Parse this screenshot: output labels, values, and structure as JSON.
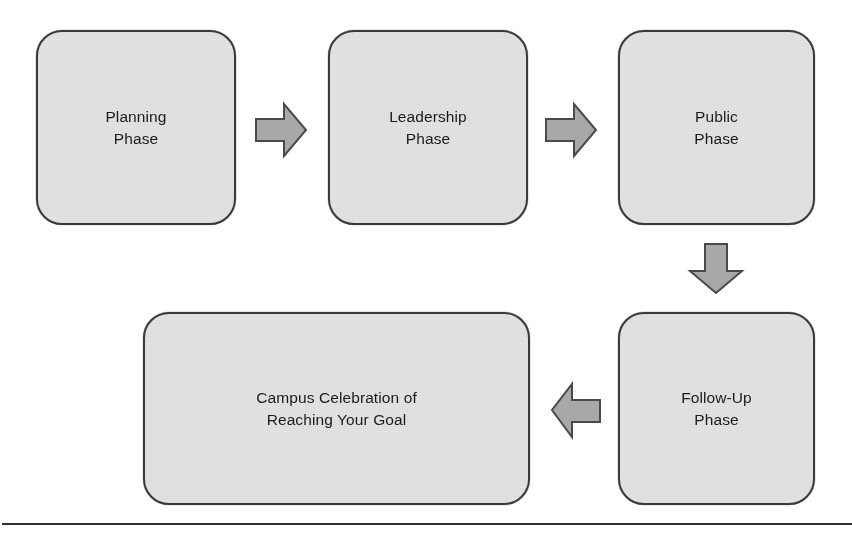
{
  "diagram": {
    "colors": {
      "box_fill": "#e4e4e4",
      "box_border": "#3a3a3a",
      "arrow_fill": "#a8a8a8",
      "arrow_border": "#4a4a4a",
      "text": "#1b1b1b",
      "rule": "#2e2e2e",
      "background": "#ffffff"
    },
    "nodes": [
      {
        "id": "planning",
        "label": "Planning\nPhase"
      },
      {
        "id": "leadership",
        "label": "Leadership\nPhase"
      },
      {
        "id": "public",
        "label": "Public\nPhase"
      },
      {
        "id": "followup",
        "label": "Follow-Up\nPhase"
      },
      {
        "id": "celebration",
        "label": "Campus Celebration of\nReaching Your Goal"
      }
    ],
    "connectors": [
      {
        "id": "planning-to-leadership",
        "direction": "right",
        "from": "planning",
        "to": "leadership"
      },
      {
        "id": "leadership-to-public",
        "direction": "right",
        "from": "leadership",
        "to": "public"
      },
      {
        "id": "public-to-followup",
        "direction": "down",
        "from": "public",
        "to": "followup"
      },
      {
        "id": "followup-to-celebration",
        "direction": "left",
        "from": "followup",
        "to": "celebration"
      }
    ],
    "footer_rule": true
  }
}
